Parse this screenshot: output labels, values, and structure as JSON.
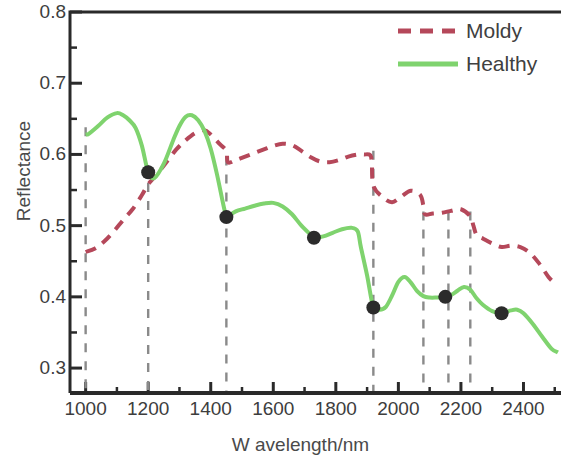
{
  "chart_data": {
    "type": "line",
    "title": "",
    "xlabel": "W avelength/nm",
    "ylabel": "Reflectance",
    "xlim": [
      950,
      2520
    ],
    "ylim": [
      0.265,
      0.8
    ],
    "grid": false,
    "legend_position": "top-right",
    "x_major_ticks": [
      1000,
      1200,
      1400,
      1600,
      1800,
      2000,
      2200,
      2400
    ],
    "x_major_tick_labels": [
      "1000",
      "1200",
      "1400",
      "1600",
      "1800",
      "2000",
      "2200",
      "2400"
    ],
    "x_minor_ticks": [
      1100,
      1300,
      1500,
      1700,
      1900,
      2100,
      2300,
      2500
    ],
    "y_major_ticks": [
      0.3,
      0.4,
      0.5,
      0.6,
      0.7,
      0.8
    ],
    "y_major_tick_labels": [
      "0.3",
      "0.4",
      "0.5",
      "0.6",
      "0.7",
      "0.8"
    ],
    "y_minor_ticks": [
      0.35,
      0.45,
      0.55,
      0.65,
      0.75
    ],
    "series": [
      {
        "name": "Moldy",
        "color": "#b5485a",
        "style": "dashed",
        "x": [
          1000,
          1030,
          1060,
          1090,
          1120,
          1150,
          1180,
          1200,
          1230,
          1260,
          1290,
          1320,
          1350,
          1380,
          1400,
          1430,
          1450,
          1455,
          1480,
          1510,
          1540,
          1570,
          1600,
          1630,
          1660,
          1690,
          1720,
          1750,
          1780,
          1810,
          1840,
          1870,
          1890,
          1910,
          1915,
          1920,
          1950,
          1980,
          2010,
          2040,
          2070,
          2080,
          2085,
          2110,
          2140,
          2170,
          2200,
          2230,
          2240,
          2250,
          2270,
          2300,
          2330,
          2360,
          2390,
          2420,
          2450,
          2480,
          2500
        ],
        "y": [
          0.463,
          0.468,
          0.478,
          0.492,
          0.508,
          0.523,
          0.543,
          0.558,
          0.573,
          0.59,
          0.607,
          0.62,
          0.63,
          0.634,
          0.628,
          0.614,
          0.605,
          0.589,
          0.592,
          0.597,
          0.602,
          0.607,
          0.612,
          0.615,
          0.613,
          0.605,
          0.596,
          0.59,
          0.589,
          0.592,
          0.597,
          0.6,
          0.6,
          0.599,
          0.588,
          0.556,
          0.54,
          0.533,
          0.541,
          0.549,
          0.543,
          0.528,
          0.516,
          0.517,
          0.518,
          0.521,
          0.523,
          0.513,
          0.5,
          0.487,
          0.482,
          0.475,
          0.47,
          0.472,
          0.47,
          0.462,
          0.447,
          0.428,
          0.419
        ]
      },
      {
        "name": "Healthy",
        "color": "#7fd36e",
        "style": "solid",
        "x": [
          1000,
          1010,
          1040,
          1070,
          1100,
          1120,
          1140,
          1160,
          1180,
          1200,
          1220,
          1250,
          1280,
          1300,
          1320,
          1340,
          1360,
          1380,
          1400,
          1420,
          1440,
          1450,
          1455,
          1480,
          1510,
          1540,
          1570,
          1600,
          1630,
          1660,
          1690,
          1720,
          1730,
          1760,
          1790,
          1820,
          1850,
          1870,
          1880,
          1900,
          1920,
          1940,
          1960,
          1980,
          2000,
          2020,
          2040,
          2060,
          2080,
          2100,
          2120,
          2150,
          2170,
          2190,
          2210,
          2230,
          2250,
          2270,
          2300,
          2330,
          2360,
          2380,
          2400,
          2430,
          2460,
          2490,
          2510
        ],
        "y": [
          0.628,
          0.629,
          0.64,
          0.652,
          0.658,
          0.655,
          0.648,
          0.637,
          0.612,
          0.575,
          0.567,
          0.587,
          0.62,
          0.64,
          0.653,
          0.655,
          0.648,
          0.633,
          0.608,
          0.572,
          0.53,
          0.512,
          0.513,
          0.52,
          0.524,
          0.528,
          0.531,
          0.532,
          0.527,
          0.516,
          0.5,
          0.487,
          0.483,
          0.485,
          0.49,
          0.495,
          0.497,
          0.492,
          0.47,
          0.43,
          0.385,
          0.382,
          0.386,
          0.402,
          0.421,
          0.428,
          0.42,
          0.408,
          0.401,
          0.399,
          0.399,
          0.4,
          0.403,
          0.409,
          0.414,
          0.41,
          0.398,
          0.389,
          0.38,
          0.377,
          0.381,
          0.382,
          0.377,
          0.362,
          0.344,
          0.327,
          0.322
        ]
      }
    ],
    "marker_points": {
      "label": "selected wavelengths",
      "color": "#2b2b2b",
      "series": "Healthy",
      "points": [
        {
          "x": 1200,
          "y": 0.575
        },
        {
          "x": 1450,
          "y": 0.512
        },
        {
          "x": 1730,
          "y": 0.483
        },
        {
          "x": 1920,
          "y": 0.385
        },
        {
          "x": 2150,
          "y": 0.4
        },
        {
          "x": 2330,
          "y": 0.377
        }
      ]
    },
    "vertical_reference_lines": {
      "color": "#8a8a8a",
      "style": "dashed",
      "x": [
        1000,
        1200,
        1450,
        1920,
        2080,
        2160,
        2230
      ]
    }
  },
  "legend": {
    "items": [
      {
        "label": "Moldy",
        "color": "#b5485a",
        "style": "dashed"
      },
      {
        "label": "Healthy",
        "color": "#7fd36e",
        "style": "solid"
      }
    ]
  },
  "axes": {
    "x_title": "W avelength/nm",
    "y_title": "Reflectance"
  }
}
